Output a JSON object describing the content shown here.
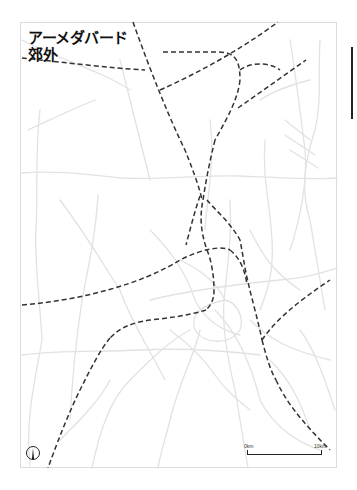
{
  "map": {
    "title_line1": "アーメダバード",
    "title_line2": "郊外",
    "scale": {
      "start_label": "0km",
      "end_label": "10km"
    },
    "north_arrow": "north-arrow-icon",
    "colors": {
      "roads": "#dedede",
      "rail": "#333333",
      "frame": "#dcdcdc",
      "text": "#111111"
    }
  }
}
